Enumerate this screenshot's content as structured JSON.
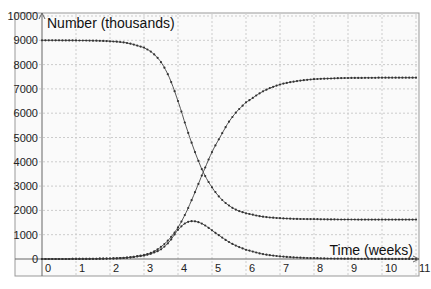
{
  "chart_data": {
    "type": "line",
    "title": "",
    "ylabel": "Number (thousands)",
    "xlabel": "Time (weeks)",
    "xlim": [
      0,
      11
    ],
    "ylim": [
      0,
      10000
    ],
    "x_ticks": [
      "0",
      "1",
      "2",
      "3",
      "4",
      "5",
      "6",
      "7",
      "8",
      "9",
      "10",
      "11"
    ],
    "y_ticks": [
      "0",
      "1000",
      "2000",
      "3000",
      "4000",
      "5000",
      "6000",
      "7000",
      "8000",
      "9000",
      "10000"
    ],
    "grid": true,
    "legend": "none",
    "x": [
      0,
      0.5,
      1,
      1.5,
      2,
      2.5,
      3,
      3.25,
      3.5,
      3.75,
      4,
      4.25,
      4.5,
      4.75,
      5,
      5.25,
      5.5,
      5.75,
      6,
      6.5,
      7,
      7.5,
      8,
      8.5,
      9,
      9.5,
      10,
      10.5,
      11
    ],
    "series": [
      {
        "name": "Susceptible",
        "values": [
          9000,
          8998,
          8994,
          8985,
          8960,
          8890,
          8700,
          8480,
          8100,
          7450,
          6500,
          5400,
          4400,
          3550,
          2950,
          2500,
          2200,
          2000,
          1880,
          1740,
          1680,
          1650,
          1640,
          1630,
          1625,
          1622,
          1620,
          1620,
          1620
        ]
      },
      {
        "name": "Recovered",
        "values": [
          0,
          1,
          3,
          8,
          20,
          55,
          160,
          280,
          500,
          830,
          1300,
          1950,
          2750,
          3600,
          4400,
          5050,
          5650,
          6100,
          6450,
          6900,
          7180,
          7320,
          7400,
          7430,
          7450,
          7455,
          7460,
          7460,
          7460
        ]
      },
      {
        "name": "Infected",
        "values": [
          0,
          1,
          3,
          7,
          20,
          55,
          140,
          240,
          400,
          720,
          1200,
          1500,
          1550,
          1420,
          1180,
          930,
          700,
          520,
          380,
          200,
          110,
          60,
          35,
          20,
          12,
          8,
          5,
          3,
          2
        ]
      }
    ]
  }
}
